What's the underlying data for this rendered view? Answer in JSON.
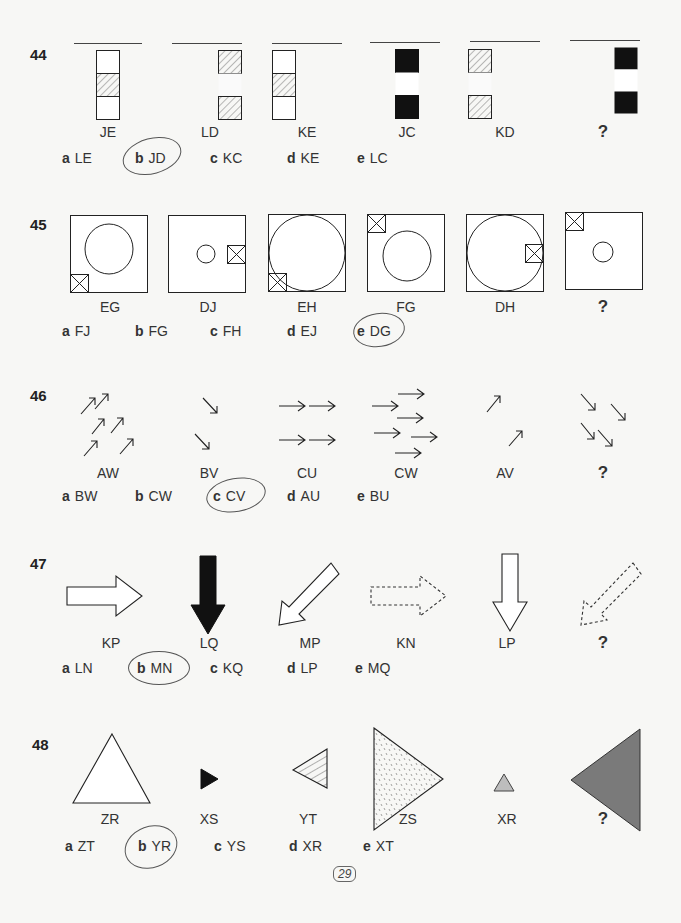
{
  "page_number": "29",
  "questions": [
    {
      "number": "44",
      "figure_labels": [
        "JE",
        "LD",
        "KE",
        "JC",
        "KD",
        "?"
      ],
      "options": [
        {
          "letter": "a",
          "code": "LE"
        },
        {
          "letter": "b",
          "code": "JD"
        },
        {
          "letter": "c",
          "code": "KC"
        },
        {
          "letter": "d",
          "code": "KE"
        },
        {
          "letter": "e",
          "code": "LC"
        }
      ],
      "circled": "b"
    },
    {
      "number": "45",
      "figure_labels": [
        "EG",
        "DJ",
        "EH",
        "FG",
        "DH",
        "?"
      ],
      "options": [
        {
          "letter": "a",
          "code": "FJ"
        },
        {
          "letter": "b",
          "code": "FG"
        },
        {
          "letter": "c",
          "code": "FH"
        },
        {
          "letter": "d",
          "code": "EJ"
        },
        {
          "letter": "e",
          "code": "DG"
        }
      ],
      "circled": "e"
    },
    {
      "number": "46",
      "figure_labels": [
        "AW",
        "BV",
        "CU",
        "CW",
        "AV",
        "?"
      ],
      "options": [
        {
          "letter": "a",
          "code": "BW"
        },
        {
          "letter": "b",
          "code": "CW"
        },
        {
          "letter": "c",
          "code": "CV"
        },
        {
          "letter": "d",
          "code": "AU"
        },
        {
          "letter": "e",
          "code": "BU"
        }
      ],
      "circled": "c"
    },
    {
      "number": "47",
      "figure_labels": [
        "KP",
        "LQ",
        "MP",
        "KN",
        "LP",
        "?"
      ],
      "options": [
        {
          "letter": "a",
          "code": "LN"
        },
        {
          "letter": "b",
          "code": "MN"
        },
        {
          "letter": "c",
          "code": "KQ"
        },
        {
          "letter": "d",
          "code": "LP"
        },
        {
          "letter": "e",
          "code": "MQ"
        }
      ],
      "circled": "b"
    },
    {
      "number": "48",
      "figure_labels": [
        "ZR",
        "XS",
        "YT",
        "ZS",
        "XR",
        "?"
      ],
      "options": [
        {
          "letter": "a",
          "code": "ZT"
        },
        {
          "letter": "b",
          "code": "YR"
        },
        {
          "letter": "c",
          "code": "YS"
        },
        {
          "letter": "d",
          "code": "XR"
        },
        {
          "letter": "e",
          "code": "XT"
        }
      ],
      "circled": "b"
    }
  ],
  "colors": {
    "ink": "#222222",
    "black_fill": "#111111",
    "light_gray_fill": "#bdbdbd",
    "dark_gray_fill": "#7a7a7a",
    "paper": "#f7f7f5"
  }
}
